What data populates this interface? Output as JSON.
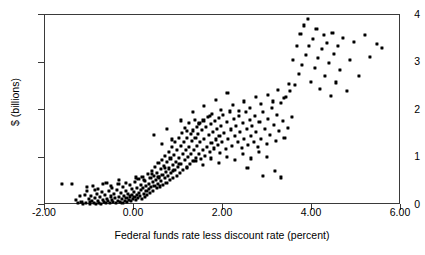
{
  "chart_data": {
    "type": "scatter",
    "title": "",
    "xlabel": "Federal funds rate less discount rate (percent)",
    "ylabel": "$ (billions)",
    "xlim": [
      -2.0,
      6.0
    ],
    "ylim": [
      0,
      4
    ],
    "xticks": [
      "-2.00",
      "0.00",
      "2.00",
      "4.00",
      "6.00"
    ],
    "xtick_values": [
      -2.0,
      0.0,
      2.0,
      4.0,
      6.0
    ],
    "yticks": [
      "0",
      "1",
      "2",
      "3",
      "4"
    ],
    "ytick_values": [
      0,
      1,
      2,
      3,
      4
    ],
    "grid": false,
    "legend": null,
    "marker": "square",
    "marker_color": "#000000",
    "points": [
      [
        -1.62,
        0.44
      ],
      [
        -1.4,
        0.44
      ],
      [
        -1.3,
        0.1
      ],
      [
        -1.26,
        0.05
      ],
      [
        -1.22,
        0.19
      ],
      [
        -1.18,
        0.07
      ],
      [
        -1.14,
        0.03
      ],
      [
        -1.1,
        0.22
      ],
      [
        -1.08,
        0.05
      ],
      [
        -1.05,
        0.3
      ],
      [
        -1.02,
        0.12
      ],
      [
        -1.0,
        0.06
      ],
      [
        -0.98,
        0.03
      ],
      [
        -0.96,
        0.2
      ],
      [
        -0.94,
        0.09
      ],
      [
        -0.92,
        0.41
      ],
      [
        -0.9,
        0.05
      ],
      [
        -0.88,
        0.14
      ],
      [
        -0.86,
        0.03
      ],
      [
        -0.84,
        0.24
      ],
      [
        -0.82,
        0.08
      ],
      [
        -0.8,
        0.33
      ],
      [
        -0.78,
        0.05
      ],
      [
        -0.76,
        0.17
      ],
      [
        -0.74,
        0.03
      ],
      [
        -0.72,
        0.27
      ],
      [
        -0.7,
        0.11
      ],
      [
        -0.68,
        0.06
      ],
      [
        -0.66,
        0.21
      ],
      [
        -0.64,
        0.04
      ],
      [
        -0.62,
        0.47
      ],
      [
        -0.6,
        0.13
      ],
      [
        -0.58,
        0.08
      ],
      [
        -0.56,
        0.29
      ],
      [
        -0.54,
        0.05
      ],
      [
        -0.52,
        0.18
      ],
      [
        -0.5,
        0.35
      ],
      [
        -0.49,
        0.1
      ],
      [
        -0.47,
        0.06
      ],
      [
        -0.45,
        0.23
      ],
      [
        -0.43,
        0.14
      ],
      [
        -0.41,
        0.04
      ],
      [
        -0.39,
        0.31
      ],
      [
        -0.37,
        0.09
      ],
      [
        -0.35,
        0.45
      ],
      [
        -0.34,
        0.17
      ],
      [
        -0.32,
        0.07
      ],
      [
        -0.3,
        0.26
      ],
      [
        -0.28,
        0.12
      ],
      [
        -0.26,
        0.05
      ],
      [
        -0.25,
        0.38
      ],
      [
        -0.23,
        0.2
      ],
      [
        -0.21,
        0.09
      ],
      [
        -0.19,
        0.3
      ],
      [
        -0.17,
        0.15
      ],
      [
        -0.16,
        0.06
      ],
      [
        -0.14,
        0.24
      ],
      [
        -0.12,
        0.11
      ],
      [
        -0.1,
        0.42
      ],
      [
        -0.09,
        0.18
      ],
      [
        -0.07,
        0.08
      ],
      [
        -0.05,
        0.33
      ],
      [
        -0.04,
        0.22
      ],
      [
        -0.02,
        0.13
      ],
      [
        0.0,
        0.28
      ],
      [
        0.01,
        0.16
      ],
      [
        0.03,
        0.48
      ],
      [
        0.04,
        0.1
      ],
      [
        0.06,
        0.36
      ],
      [
        0.07,
        0.21
      ],
      [
        0.09,
        0.14
      ],
      [
        0.1,
        0.55
      ],
      [
        0.12,
        0.26
      ],
      [
        0.13,
        0.19
      ],
      [
        0.15,
        0.42
      ],
      [
        0.16,
        0.31
      ],
      [
        0.18,
        0.12
      ],
      [
        0.19,
        0.6
      ],
      [
        0.21,
        0.35
      ],
      [
        0.22,
        0.24
      ],
      [
        0.24,
        0.17
      ],
      [
        0.25,
        0.5
      ],
      [
        0.27,
        0.4
      ],
      [
        0.28,
        0.29
      ],
      [
        0.3,
        0.22
      ],
      [
        0.31,
        0.66
      ],
      [
        0.33,
        0.45
      ],
      [
        0.34,
        0.33
      ],
      [
        0.36,
        0.26
      ],
      [
        0.37,
        0.57
      ],
      [
        0.39,
        0.38
      ],
      [
        0.4,
        0.72
      ],
      [
        0.42,
        0.48
      ],
      [
        0.43,
        0.3
      ],
      [
        0.45,
        0.62
      ],
      [
        0.46,
        0.41
      ],
      [
        0.48,
        0.8
      ],
      [
        0.49,
        0.52
      ],
      [
        0.51,
        0.35
      ],
      [
        0.52,
        0.68
      ],
      [
        0.54,
        0.44
      ],
      [
        0.55,
        0.88
      ],
      [
        0.57,
        0.58
      ],
      [
        0.58,
        0.39
      ],
      [
        0.6,
        0.75
      ],
      [
        0.61,
        0.5
      ],
      [
        0.63,
        0.95
      ],
      [
        0.64,
        0.64
      ],
      [
        0.66,
        0.43
      ],
      [
        0.67,
        0.82
      ],
      [
        0.69,
        0.56
      ],
      [
        0.7,
        1.03
      ],
      [
        0.72,
        0.7
      ],
      [
        0.73,
        0.47
      ],
      [
        0.75,
        0.9
      ],
      [
        0.76,
        0.62
      ],
      [
        0.78,
        1.12
      ],
      [
        0.79,
        0.77
      ],
      [
        0.81,
        0.52
      ],
      [
        0.82,
        0.98
      ],
      [
        0.84,
        0.68
      ],
      [
        0.85,
        1.22
      ],
      [
        0.87,
        0.84
      ],
      [
        0.88,
        0.57
      ],
      [
        0.9,
        1.06
      ],
      [
        0.91,
        0.74
      ],
      [
        0.93,
        1.32
      ],
      [
        0.94,
        0.91
      ],
      [
        0.96,
        0.62
      ],
      [
        0.97,
        1.15
      ],
      [
        0.99,
        0.8
      ],
      [
        1.0,
        1.42
      ],
      [
        1.02,
        0.99
      ],
      [
        1.03,
        0.68
      ],
      [
        1.05,
        1.24
      ],
      [
        1.06,
        0.87
      ],
      [
        1.08,
        1.52
      ],
      [
        1.09,
        1.07
      ],
      [
        1.11,
        0.74
      ],
      [
        1.12,
        1.33
      ],
      [
        1.14,
        0.94
      ],
      [
        1.15,
        1.62
      ],
      [
        1.17,
        1.15
      ],
      [
        1.18,
        0.8
      ],
      [
        1.2,
        1.41
      ],
      [
        1.21,
        1.01
      ],
      [
        1.23,
        1.72
      ],
      [
        1.24,
        1.23
      ],
      [
        1.26,
        0.86
      ],
      [
        1.27,
        1.49
      ],
      [
        1.29,
        1.08
      ],
      [
        1.3,
        1.34
      ],
      [
        1.32,
        0.93
      ],
      [
        1.33,
        1.57
      ],
      [
        1.35,
        1.16
      ],
      [
        1.36,
        1.8
      ],
      [
        1.38,
        1.42
      ],
      [
        1.39,
        1.0
      ],
      [
        1.41,
        1.65
      ],
      [
        1.42,
        1.24
      ],
      [
        1.44,
        1.5
      ],
      [
        1.45,
        1.07
      ],
      [
        1.47,
        1.72
      ],
      [
        1.48,
        1.32
      ],
      [
        1.5,
        0.96
      ],
      [
        1.52,
        1.58
      ],
      [
        1.54,
        1.15
      ],
      [
        1.56,
        1.78
      ],
      [
        1.58,
        1.4
      ],
      [
        1.6,
        1.04
      ],
      [
        1.62,
        1.64
      ],
      [
        1.64,
        1.23
      ],
      [
        1.66,
        1.85
      ],
      [
        1.68,
        1.47
      ],
      [
        1.7,
        1.12
      ],
      [
        1.72,
        1.7
      ],
      [
        1.74,
        1.31
      ],
      [
        1.76,
        1.92
      ],
      [
        1.78,
        1.54
      ],
      [
        1.8,
        1.19
      ],
      [
        1.82,
        1.76
      ],
      [
        1.84,
        1.38
      ],
      [
        1.86,
        1.6
      ],
      [
        1.88,
        1.26
      ],
      [
        1.9,
        1.83
      ],
      [
        1.92,
        1.45
      ],
      [
        1.94,
        1.1
      ],
      [
        1.96,
        1.67
      ],
      [
        1.98,
        1.33
      ],
      [
        2.0,
        1.9
      ],
      [
        2.03,
        1.52
      ],
      [
        2.06,
        1.18
      ],
      [
        2.09,
        1.74
      ],
      [
        2.12,
        1.4
      ],
      [
        2.15,
        1.97
      ],
      [
        2.18,
        1.59
      ],
      [
        2.21,
        1.25
      ],
      [
        2.24,
        1.81
      ],
      [
        2.27,
        1.46
      ],
      [
        2.3,
        1.66
      ],
      [
        2.33,
        1.32
      ],
      [
        2.36,
        1.88
      ],
      [
        2.39,
        1.53
      ],
      [
        2.42,
        1.2
      ],
      [
        2.45,
        1.73
      ],
      [
        2.48,
        1.39
      ],
      [
        2.51,
        1.95
      ],
      [
        2.54,
        1.6
      ],
      [
        2.57,
        1.27
      ],
      [
        2.6,
        1.8
      ],
      [
        2.63,
        1.46
      ],
      [
        2.66,
        1.66
      ],
      [
        2.69,
        1.33
      ],
      [
        2.72,
        1.88
      ],
      [
        2.75,
        1.53
      ],
      [
        2.78,
        1.22
      ],
      [
        2.82,
        1.74
      ],
      [
        2.86,
        1.4
      ],
      [
        2.9,
        1.96
      ],
      [
        2.94,
        1.6
      ],
      [
        2.98,
        1.28
      ],
      [
        3.02,
        1.82
      ],
      [
        3.06,
        1.47
      ],
      [
        3.1,
        2.05
      ],
      [
        3.14,
        1.68
      ],
      [
        3.18,
        1.35
      ],
      [
        3.22,
        1.9
      ],
      [
        3.26,
        1.55
      ],
      [
        3.3,
        2.15
      ],
      [
        3.34,
        1.76
      ],
      [
        3.38,
        1.42
      ],
      [
        3.42,
        2.28
      ],
      [
        3.46,
        1.63
      ],
      [
        3.5,
        2.4
      ],
      [
        3.54,
        1.85
      ],
      [
        3.58,
        3.05
      ],
      [
        3.62,
        2.52
      ],
      [
        3.66,
        3.35
      ],
      [
        3.7,
        2.75
      ],
      [
        3.74,
        3.6
      ],
      [
        3.78,
        2.95
      ],
      [
        3.82,
        3.78
      ],
      [
        3.86,
        3.15
      ],
      [
        3.9,
        3.92
      ],
      [
        3.94,
        3.35
      ],
      [
        3.98,
        2.6
      ],
      [
        4.02,
        3.5
      ],
      [
        4.06,
        2.88
      ],
      [
        4.1,
        3.7
      ],
      [
        4.14,
        3.1
      ],
      [
        4.18,
        2.45
      ],
      [
        4.22,
        3.28
      ],
      [
        4.26,
        3.58
      ],
      [
        4.3,
        2.72
      ],
      [
        4.34,
        3.42
      ],
      [
        4.38,
        3.0
      ],
      [
        4.42,
        2.3
      ],
      [
        4.46,
        3.62
      ],
      [
        4.5,
        3.18
      ],
      [
        4.54,
        2.58
      ],
      [
        4.58,
        3.35
      ],
      [
        4.62,
        2.85
      ],
      [
        4.7,
        3.52
      ],
      [
        4.78,
        2.4
      ],
      [
        4.86,
        3.05
      ],
      [
        4.94,
        3.44
      ],
      [
        5.05,
        2.72
      ],
      [
        5.18,
        3.58
      ],
      [
        5.3,
        3.12
      ],
      [
        5.45,
        3.4
      ],
      [
        5.58,
        3.3
      ],
      [
        0.44,
        1.47
      ],
      [
        0.62,
        1.28
      ],
      [
        0.74,
        1.6
      ],
      [
        0.86,
        1.38
      ],
      [
        1.05,
        1.78
      ],
      [
        1.18,
        1.55
      ],
      [
        1.32,
        1.95
      ],
      [
        1.46,
        1.7
      ],
      [
        1.58,
        2.08
      ],
      [
        1.7,
        1.88
      ],
      [
        1.84,
        2.22
      ],
      [
        1.96,
        2.0
      ],
      [
        2.1,
        2.35
      ],
      [
        2.22,
        2.1
      ],
      [
        2.35,
        1.98
      ],
      [
        2.48,
        2.18
      ],
      [
        2.6,
        2.05
      ],
      [
        2.74,
        2.28
      ],
      [
        2.86,
        2.12
      ],
      [
        3.0,
        2.32
      ],
      [
        3.12,
        2.18
      ],
      [
        3.24,
        2.42
      ],
      [
        3.36,
        2.25
      ],
      [
        3.48,
        2.55
      ],
      [
        -1.05,
        0.38
      ],
      [
        -0.88,
        0.31
      ],
      [
        -0.7,
        0.44
      ],
      [
        -0.52,
        0.4
      ],
      [
        -0.34,
        0.52
      ],
      [
        -0.18,
        0.47
      ],
      [
        0.05,
        0.58
      ],
      [
        0.22,
        0.52
      ],
      [
        0.4,
        0.66
      ],
      [
        0.55,
        0.6
      ],
      [
        0.7,
        0.78
      ],
      [
        0.88,
        0.72
      ],
      [
        1.02,
        0.86
      ],
      [
        1.2,
        0.78
      ],
      [
        1.38,
        0.92
      ],
      [
        1.55,
        0.84
      ],
      [
        1.72,
        0.98
      ],
      [
        1.9,
        0.88
      ],
      [
        2.08,
        1.02
      ],
      [
        2.26,
        0.94
      ],
      [
        2.44,
        1.08
      ],
      [
        2.62,
        0.98
      ],
      [
        2.8,
        1.12
      ],
      [
        2.98,
        1.02
      ],
      [
        3.16,
        0.72
      ],
      [
        3.3,
        0.58
      ],
      [
        2.55,
        0.78
      ],
      [
        2.9,
        0.62
      ]
    ]
  }
}
